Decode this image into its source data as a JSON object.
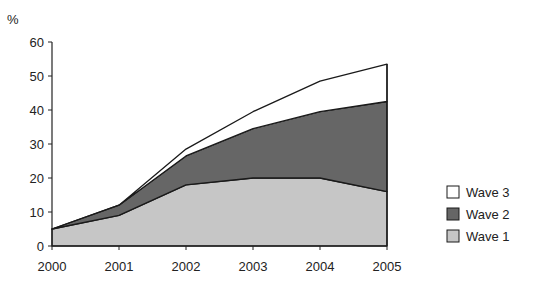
{
  "chart_data": {
    "type": "area",
    "stacked": true,
    "title": "",
    "xlabel": "",
    "ylabel": "%",
    "x": [
      "2000",
      "2001",
      "2002",
      "2003",
      "2004",
      "2005"
    ],
    "ylim": [
      0,
      60
    ],
    "yticks": [
      0,
      10,
      20,
      30,
      40,
      50,
      60
    ],
    "grid": false,
    "legend_position": "right",
    "series": [
      {
        "name": "Wave 1",
        "values": [
          5,
          9,
          18,
          20,
          20,
          16
        ],
        "color": "#c6c6c6"
      },
      {
        "name": "Wave 2",
        "values": [
          0,
          3,
          8.5,
          14.5,
          19.5,
          26.5
        ],
        "color": "#666666"
      },
      {
        "name": "Wave 3",
        "values": [
          0,
          0,
          2,
          5,
          9,
          11
        ],
        "color": "#ffffff"
      }
    ],
    "cumulative_tops": {
      "Wave 1": [
        5,
        9,
        18,
        20,
        20,
        16
      ],
      "Wave 2": [
        5,
        12,
        26.5,
        34.5,
        39.5,
        42.5
      ],
      "Wave 3": [
        5,
        12,
        28.5,
        39.5,
        48.5,
        53.5
      ]
    }
  },
  "axis": {
    "y_unit_label": "%",
    "y_tick_labels": [
      "0",
      "10",
      "20",
      "30",
      "40",
      "50",
      "60"
    ],
    "x_tick_labels": [
      "2000",
      "2001",
      "2002",
      "2003",
      "2004",
      "2005"
    ]
  },
  "legend": {
    "items": [
      {
        "label": "Wave 3",
        "color": "#ffffff"
      },
      {
        "label": "Wave 2",
        "color": "#666666"
      },
      {
        "label": "Wave 1",
        "color": "#c6c6c6"
      }
    ]
  }
}
